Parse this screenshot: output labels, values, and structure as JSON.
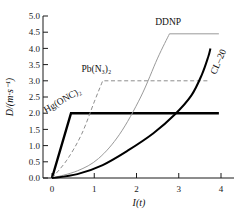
{
  "chart_data": {
    "type": "line",
    "title": "",
    "xlabel": "I(t)",
    "ylabel": "D/(m·s⁻¹)",
    "xlim": [
      -0.35,
      4.35
    ],
    "ylim": [
      0.0,
      5.0
    ],
    "grid": false,
    "legend_position": "inline-annotations",
    "xticks": [
      0,
      1,
      2,
      3,
      4
    ],
    "xtick_labels": [
      "0",
      "1",
      "2",
      "3",
      "4"
    ],
    "yticks": [
      0.0,
      0.5,
      1.0,
      1.5,
      2.0,
      2.5,
      3.0,
      3.5,
      4.0,
      4.5,
      5.0
    ],
    "ytick_labels": [
      "0.0",
      "0.5",
      "1.0",
      "1.5",
      "2.0",
      "2.5",
      "3.0",
      "3.5",
      "4.0",
      "4.5",
      "5.0"
    ],
    "series": [
      {
        "name": "Hg(ONC)2",
        "label": "Hg(ONC)₂",
        "style": "solid",
        "color": "#000000",
        "width": 2.4,
        "plateau": 2.0,
        "rise_end_x": 0.45,
        "end_x": 3.95,
        "points": [
          [
            0.0,
            0.0
          ],
          [
            0.45,
            2.0
          ],
          [
            3.95,
            2.0
          ]
        ]
      },
      {
        "name": "Pb(N3)2",
        "label": "Pb(N₃)₂",
        "style": "dashed",
        "color": "#8d8d8d",
        "width": 1.0,
        "plateau": 3.0,
        "rise_end_x": 1.2,
        "end_x": 3.72,
        "points": [
          [
            0.0,
            0.0
          ],
          [
            0.35,
            0.55
          ],
          [
            0.7,
            1.35
          ],
          [
            1.0,
            2.35
          ],
          [
            1.2,
            3.0
          ],
          [
            3.72,
            3.0
          ]
        ]
      },
      {
        "name": "DDNP",
        "label": "DDNP",
        "style": "solid",
        "color": "#9a9a9a",
        "width": 1.0,
        "plateau": 4.45,
        "rise_end_x": 2.78,
        "end_x": 3.95,
        "points": [
          [
            0.0,
            0.0
          ],
          [
            0.6,
            0.22
          ],
          [
            1.1,
            0.6
          ],
          [
            1.6,
            1.35
          ],
          [
            2.1,
            2.5
          ],
          [
            2.5,
            3.7
          ],
          [
            2.78,
            4.45
          ],
          [
            3.95,
            4.45
          ]
        ]
      },
      {
        "name": "CL-20",
        "label": "CL–20",
        "style": "solid",
        "color": "#000000",
        "width": 2.0,
        "plateau": null,
        "end_x": 3.75,
        "end_y": 4.0,
        "points": [
          [
            0.0,
            0.0
          ],
          [
            0.6,
            0.12
          ],
          [
            1.2,
            0.4
          ],
          [
            1.8,
            0.85
          ],
          [
            2.4,
            1.38
          ],
          [
            2.9,
            1.95
          ],
          [
            3.3,
            2.55
          ],
          [
            3.55,
            3.2
          ],
          [
            3.7,
            3.75
          ],
          [
            3.75,
            4.0
          ]
        ]
      }
    ],
    "annotations": [
      {
        "text": "DDNP",
        "x": 2.75,
        "y": 4.72,
        "rotation": 0
      },
      {
        "text": "CL–20",
        "x": 4.0,
        "y": 3.55,
        "rotation": -66
      },
      {
        "text": "Pb(N₃)₂",
        "x": 1.05,
        "y": 3.28,
        "rotation": 0
      },
      {
        "text": "Hg(ONC)₂",
        "x": 0.28,
        "y": 2.32,
        "rotation": -30
      }
    ]
  },
  "figure": {
    "background": "#ffffff",
    "axis_color": "#1a1a1a"
  }
}
